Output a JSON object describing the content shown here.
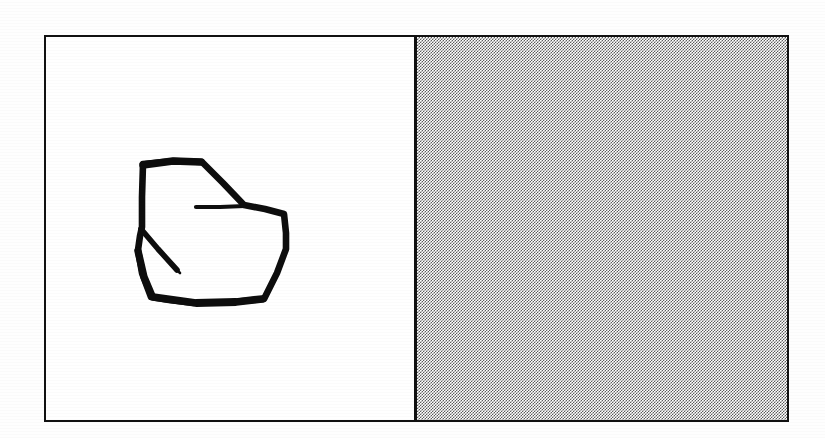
{
  "figure": {
    "background_color": "#ffffff",
    "frame": {
      "border_color": "#111111",
      "border_width_px": 2.5,
      "x": 44,
      "y": 35,
      "width": 745,
      "height": 387
    },
    "panels": [
      {
        "name": "left-white-panel",
        "fill": "#ffffff",
        "fill_description": "plain white",
        "width_px": 368
      },
      {
        "name": "right-shaded-panel",
        "fill": "#808080",
        "fill_description": "halftone checkerboard dither, approximately 50 percent gray",
        "pattern": "checkerboard",
        "pattern_cell_px": 1.5,
        "width_px": 374
      }
    ],
    "divider": {
      "name": "vertical-divider",
      "color": "#111111",
      "width_px": 2.5,
      "x_in_frame": 368
    },
    "sketch": {
      "name": "hand-drawn-polygon",
      "stroke_color": "#0d0d0d",
      "stroke_width_px": 6,
      "closed": true,
      "vertex_count": 8,
      "description": "irregular hand-drawn closed heptagon-like loop with two short overprinted tails",
      "bounds": {
        "x": 140,
        "y": 158,
        "width": 184,
        "height": 144
      },
      "vertices": [
        [
          97,
          127
        ],
        [
          156,
          125
        ],
        [
          198,
          168
        ],
        [
          238,
          177
        ],
        [
          240,
          212
        ],
        [
          218,
          262
        ],
        [
          148,
          266
        ],
        [
          105,
          260
        ],
        [
          92,
          213
        ],
        [
          96,
          190
        ],
        [
          97,
          127
        ]
      ],
      "tails": [
        {
          "name": "upper-right-tail",
          "description": "short horizontal stroke overshooting the right-upper vertex, pointing left",
          "points": [
            [
              198,
              168
            ],
            [
              150,
              170
            ]
          ]
        },
        {
          "name": "left-inward-spike",
          "description": "short stroke spiking inward and downward from the left vertex",
          "points": [
            [
              96,
              192
            ],
            [
              132,
              232
            ]
          ]
        }
      ]
    }
  }
}
